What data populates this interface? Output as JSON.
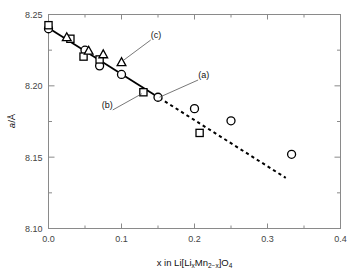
{
  "chart_data": {
    "type": "scatter",
    "title": "",
    "xlabel": "x in Li[LixMn2-x]O4",
    "xlabel_parts": {
      "lead": "x in Li[Li",
      "sub1": "x",
      "mid": "Mn",
      "sub2": "2−x",
      "close": "]O",
      "sub3": "4"
    },
    "ylabel": "a/Å",
    "ylabel_parts": {
      "italic": "a",
      "rest": "/Å"
    },
    "xlim": [
      0.0,
      0.4
    ],
    "ylim": [
      8.1,
      8.25
    ],
    "xticks": [
      0.0,
      0.1,
      0.2,
      0.3,
      0.4
    ],
    "xticklabels": [
      "0.0",
      "0.1",
      "0.2",
      "0.3",
      "0.4"
    ],
    "xminorticks": [
      0.05,
      0.15,
      0.25,
      0.35
    ],
    "yticks": [
      8.1,
      8.15,
      8.2,
      8.25
    ],
    "yticklabels": [
      "8.10",
      "8.15",
      "8.20",
      "8.25"
    ],
    "yminorticks": [
      8.125,
      8.175,
      8.225
    ],
    "grid": false,
    "legend": null,
    "series": [
      {
        "name": "circle",
        "marker": "circle",
        "color": "#000000",
        "points": [
          {
            "x": 0.0,
            "y": 8.24
          },
          {
            "x": 0.05,
            "y": 8.225
          },
          {
            "x": 0.07,
            "y": 8.214
          },
          {
            "x": 0.1,
            "y": 8.208
          },
          {
            "x": 0.15,
            "y": 8.192
          },
          {
            "x": 0.2,
            "y": 8.184
          },
          {
            "x": 0.25,
            "y": 8.1755
          },
          {
            "x": 0.333,
            "y": 8.152
          }
        ]
      },
      {
        "name": "square",
        "marker": "square",
        "color": "#000000",
        "points": [
          {
            "x": 0.0,
            "y": 8.2425
          },
          {
            "x": 0.03,
            "y": 8.233
          },
          {
            "x": 0.048,
            "y": 8.2205
          },
          {
            "x": 0.07,
            "y": 8.2185
          },
          {
            "x": 0.13,
            "y": 8.1955
          },
          {
            "x": 0.207,
            "y": 8.167
          }
        ]
      },
      {
        "name": "triangle",
        "marker": "triangle",
        "color": "#000000",
        "points": [
          {
            "x": 0.025,
            "y": 8.234
          },
          {
            "x": 0.055,
            "y": 8.2245
          },
          {
            "x": 0.075,
            "y": 8.222
          },
          {
            "x": 0.1,
            "y": 8.2165
          }
        ]
      }
    ],
    "lines": [
      {
        "name": "solid-fit",
        "style": "solid",
        "x0": 0.0,
        "y0": 8.2405,
        "x1": 0.152,
        "y1": 8.1915
      },
      {
        "name": "dashed-extrapolation",
        "style": "dashed",
        "x0": 0.152,
        "y0": 8.1915,
        "x1": 0.325,
        "y1": 8.1355
      }
    ],
    "annotations": [
      {
        "label": "(a)",
        "text_x": 0.205,
        "text_y": 8.2055,
        "point_x": 0.152,
        "point_y": 8.192
      },
      {
        "label": "(b)",
        "text_x": 0.088,
        "text_y": 8.1845,
        "point_x": 0.128,
        "point_y": 8.1945
      },
      {
        "label": "(c)",
        "text_x": 0.14,
        "text_y": 8.2335,
        "point_x": 0.103,
        "point_y": 8.218
      }
    ]
  }
}
